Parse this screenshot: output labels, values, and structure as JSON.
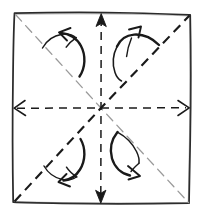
{
  "figure": {
    "kind": "origami-crease-pattern",
    "title": "Origami square base crease pattern with squash-fold arrows",
    "style": "hand-drawn pen sketch",
    "background_color": "#ffffff",
    "ink_color": "#1a1a1a",
    "faint_ink_color": "#9a9a9a"
  },
  "canvas": {
    "width": 202,
    "height": 216
  },
  "sheet": {
    "name": "paper-square",
    "label": "Square sheet of paper",
    "line_style": "solid",
    "stroke_color": "#2b2b2b",
    "stroke_width": 1.7,
    "corners": {
      "top_left": [
        14,
        13
      ],
      "top_right": [
        190,
        15
      ],
      "bottom_right": [
        189,
        203
      ],
      "bottom_left": [
        13,
        202
      ]
    }
  },
  "center_point": {
    "name": "center",
    "label": "Center of sheet",
    "x": 101,
    "y": 108
  },
  "fold_lines": [
    {
      "id": "diagonal-ne-sw",
      "label": "Diagonal fold (bottom-left to top-right)",
      "line_style": "dashed",
      "weight": "bold",
      "stroke_color": "#1a1a1a",
      "stroke_width": 2.1,
      "dash_pattern": "9 6",
      "from": [
        14,
        202
      ],
      "to": [
        190,
        15
      ],
      "arrowheads": "none"
    },
    {
      "id": "diagonal-nw-se",
      "label": "Diagonal fold (top-left to bottom-right)",
      "line_style": "dashed",
      "weight": "faint",
      "stroke_color": "#9a9a9a",
      "stroke_width": 1.25,
      "dash_pattern": "9 6",
      "from": [
        15,
        14
      ],
      "to": [
        189,
        203
      ],
      "arrowheads": "none"
    },
    {
      "id": "midline-horizontal",
      "label": "Horizontal mid fold line",
      "line_style": "dashed",
      "weight": "medium",
      "stroke_color": "#1a1a1a",
      "stroke_width": 1.5,
      "dash_pattern": "8 6",
      "from": [
        14,
        108
      ],
      "to": [
        189,
        108
      ],
      "arrowheads": "both"
    },
    {
      "id": "midline-vertical",
      "label": "Vertical mid fold line",
      "line_style": "dashed",
      "weight": "medium",
      "stroke_color": "#1a1a1a",
      "stroke_width": 1.5,
      "dash_pattern": "8 6",
      "from": [
        101,
        14
      ],
      "to": [
        101,
        202
      ],
      "arrowheads": "both"
    }
  ],
  "edge_arrowheads": [
    {
      "id": "arrowhead-left",
      "label": "Arrowhead at left edge",
      "at": [
        14,
        108
      ],
      "direction": "left"
    },
    {
      "id": "arrowhead-right",
      "label": "Arrowhead at right edge",
      "at": [
        189,
        108
      ],
      "direction": "right"
    },
    {
      "id": "arrowhead-top",
      "label": "Arrowhead at top edge",
      "at": [
        101,
        14
      ],
      "direction": "up"
    },
    {
      "id": "arrowhead-bottom",
      "label": "Arrowhead at bottom edge",
      "at": [
        101,
        202
      ],
      "direction": "down"
    }
  ],
  "fold_arrows": [
    {
      "id": "fold-arrow-top-left",
      "label": "Squash fold arrow, top-left quadrant",
      "quadrant": "top-left",
      "points_toward": "up-left",
      "stroke_color": "#1a1a1a"
    },
    {
      "id": "fold-arrow-top-right",
      "label": "Squash fold arrow, top-right quadrant",
      "quadrant": "top-right",
      "points_toward": "up-right",
      "stroke_color": "#1a1a1a"
    },
    {
      "id": "fold-arrow-bottom-left",
      "label": "Squash fold arrow, bottom-left quadrant",
      "quadrant": "bottom-left",
      "points_toward": "down-left",
      "stroke_color": "#1a1a1a"
    },
    {
      "id": "fold-arrow-bottom-right",
      "label": "Squash fold arrow, bottom-right quadrant",
      "quadrant": "bottom-right",
      "points_toward": "down-right",
      "stroke_color": "#1a1a1a"
    }
  ]
}
